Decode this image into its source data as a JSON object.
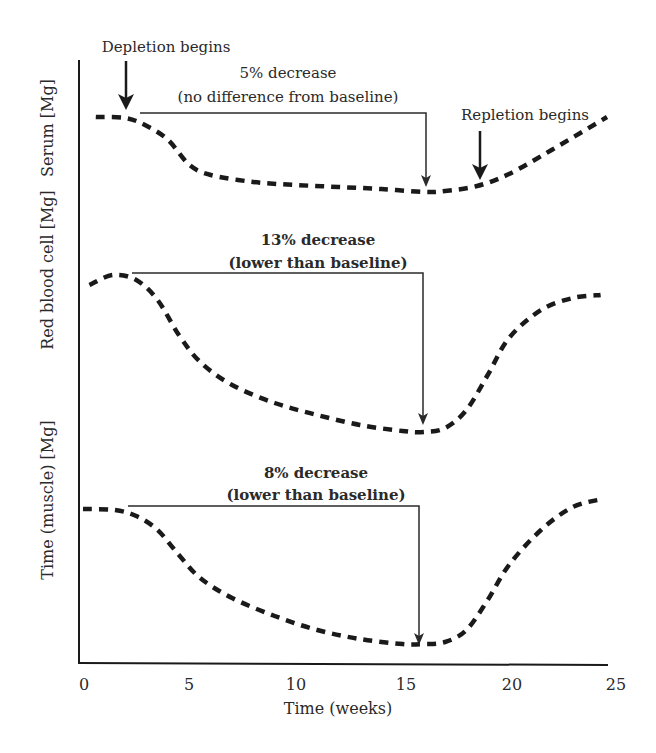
{
  "chart_data": {
    "type": "line",
    "title": "",
    "xlabel": "Time (weeks)",
    "xlim": [
      0,
      25
    ],
    "xticks": [
      0,
      5,
      10,
      15,
      20,
      25
    ],
    "grid": false,
    "legend": null,
    "panels": [
      {
        "ylabel": "Serum [Mg]",
        "annotation_line1": "5% decrease",
        "annotation_line2": "(no difference from baseline)",
        "annotation_bold": false,
        "bracket": {
          "x_start": 2.7,
          "x_end": 16.1,
          "y_px": 113,
          "tip_y_px": 186
        },
        "series": {
          "name": "Serum Mg",
          "x": [
            0.6,
            2,
            3,
            4,
            5,
            6,
            8,
            10,
            12,
            14,
            16,
            17,
            18.5,
            20,
            22,
            24.6
          ],
          "y_px": [
            117,
            118,
            126,
            140,
            165,
            175,
            182,
            185,
            187,
            189,
            192,
            191,
            186,
            174,
            150,
            117
          ]
        }
      },
      {
        "ylabel": "Red blood cell [Mg]",
        "annotation_line1": "13% decrease",
        "annotation_line2": "(lower than baseline)",
        "annotation_bold": true,
        "bracket": {
          "x_start": 2.3,
          "x_end": 15.9,
          "y_px": 272,
          "tip_y_px": 425
        },
        "series": {
          "name": "Red blood cell Mg",
          "x": [
            0.3,
            1.4,
            2.5,
            3.5,
            4.5,
            5.5,
            7,
            9,
            11,
            13,
            15,
            16,
            17,
            18,
            19,
            20,
            21.5,
            23,
            24.3
          ],
          "y_px": [
            285,
            275,
            280,
            300,
            335,
            362,
            385,
            403,
            415,
            425,
            431,
            432,
            428,
            410,
            375,
            338,
            310,
            298,
            295
          ]
        }
      },
      {
        "ylabel": "Time (muscle) [Mg]",
        "annotation_line1": "8% decrease",
        "annotation_line2": "(lower than baseline)",
        "annotation_bold": true,
        "bracket": {
          "x_start": 2.1,
          "x_end": 15.7,
          "y_px": 505,
          "tip_y_px": 645
        },
        "series": {
          "name": "Muscle Mg",
          "x": [
            0,
            1.5,
            2.5,
            3.5,
            4.5,
            5.5,
            7,
            9,
            11,
            13,
            15,
            16,
            17,
            18,
            19,
            20,
            21.5,
            23,
            24.4
          ],
          "y_px": [
            509,
            510,
            516,
            530,
            555,
            578,
            598,
            616,
            630,
            639,
            644,
            644,
            642,
            630,
            600,
            565,
            530,
            507,
            499
          ]
        }
      }
    ],
    "annotations": [
      {
        "text": "Depletion begins",
        "x": 2,
        "type": "arrow"
      },
      {
        "text": "Repletion begins",
        "x": 18.6,
        "type": "arrow"
      }
    ]
  },
  "labels": {
    "depletion": "Depletion begins",
    "repletion": "Repletion begins",
    "xlabel": "Time (weeks)",
    "yl_serum": "Serum [Mg]",
    "yl_rbc": "Red blood cell [Mg]",
    "yl_muscle": "Time (muscle) [Mg]",
    "serum_a1": "5% decrease",
    "serum_a2": "(no difference from baseline)",
    "rbc_a1": "13% decrease",
    "rbc_a2": "(lower than baseline)",
    "mus_a1": "8% decrease",
    "mus_a2": "(lower than baseline)",
    "t0": "0",
    "t5": "5",
    "t10": "10",
    "t15": "15",
    "t20": "20",
    "t25": "25"
  },
  "colors": {
    "ink": "#1a1a1a",
    "background": "#ffffff"
  }
}
